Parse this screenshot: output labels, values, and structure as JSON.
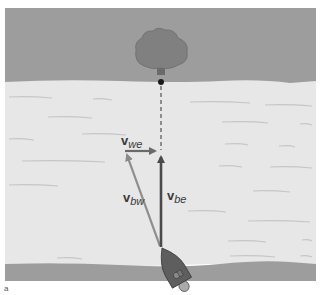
{
  "figure": {
    "type": "physics vector diagram",
    "scene": "boat crossing river toward tree on far bank",
    "colors": {
      "bank": "#9a9a9a",
      "water": "#e6e6e6",
      "ripple": "#c8c8c8",
      "tree": "#7e7e7e",
      "boat": "#5e5e5e",
      "vector_dark": "#4a4a4a",
      "vector_light": "#8e8e8e"
    }
  },
  "vectors": {
    "vwe": {
      "bold": "v",
      "sub": "we",
      "meaning": "velocity of water relative to earth"
    },
    "vbw": {
      "bold": "v",
      "sub": "bw",
      "meaning": "velocity of boat relative to water"
    },
    "vbe": {
      "bold": "v",
      "sub": "be",
      "meaning": "velocity of boat relative to earth"
    }
  },
  "caption": "a"
}
